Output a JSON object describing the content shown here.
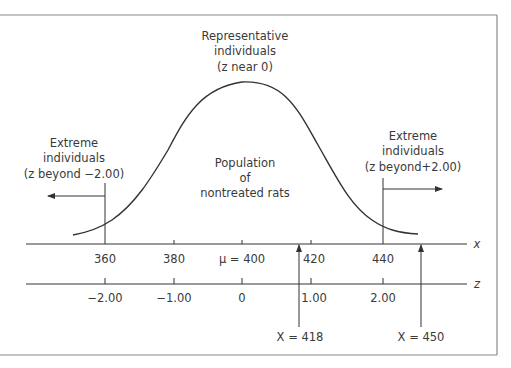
{
  "figure": {
    "annotations": {
      "representative": {
        "line1": "Representative",
        "line2": "individuals",
        "line3": "(z near 0)"
      },
      "extreme_left": {
        "line1": "Extreme",
        "line2": "individuals",
        "line3": "(z beyond −2.00)"
      },
      "extreme_right": {
        "line1": "Extreme",
        "line2": "individuals",
        "line3": "(z beyond+2.00)"
      },
      "population": {
        "line1": "Population",
        "line2": "of",
        "line3": "nontreated rats"
      }
    },
    "x_axis": {
      "label": "x",
      "ticks": [
        "360",
        "380",
        "μ = 400",
        "420",
        "440"
      ]
    },
    "z_axis": {
      "label": "z",
      "ticks": [
        "−2.00",
        "−1.00",
        "0",
        "1.00",
        "2.00"
      ]
    },
    "markers": [
      {
        "label": "X = 418",
        "x_value": 418
      },
      {
        "label": "X = 450",
        "x_value": 450
      }
    ],
    "colors": {
      "line": "#333333",
      "text": "#3a3a3a",
      "frame": "#888888"
    }
  }
}
